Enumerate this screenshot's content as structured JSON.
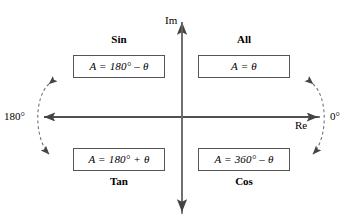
{
  "diagram": {
    "axes": {
      "imaginary_label": "Im",
      "real_label": "Re",
      "left_angle_label": "180°",
      "right_angle_label": "0°",
      "origin_x": 182,
      "origin_y": 117
    },
    "quadrants": [
      {
        "key": "sin",
        "name": "Sin",
        "formula": "A = 180° – θ",
        "position": "top-left",
        "label_placement": "above-box"
      },
      {
        "key": "all",
        "name": "All",
        "formula": "A = θ",
        "position": "top-right",
        "label_placement": "above-box"
      },
      {
        "key": "tan",
        "name": "Tan",
        "formula": "A = 180° + θ",
        "position": "bottom-left",
        "label_placement": "below-box"
      },
      {
        "key": "cos",
        "name": "Cos",
        "formula": "A = 360° – θ",
        "position": "bottom-right",
        "label_placement": "below-box"
      }
    ],
    "arcs": [
      {
        "key": "left-rotation-arc",
        "side": "left",
        "style": "dashed",
        "arrowheads": "both-ends",
        "near_label": "180°"
      },
      {
        "key": "right-rotation-arc",
        "side": "right",
        "style": "dashed",
        "arrowheads": "both-ends",
        "near_label": "0°"
      }
    ],
    "colors": {
      "background": "#ffffff",
      "stroke": "#444444",
      "box_border": "#555555",
      "text": "#000000"
    }
  }
}
